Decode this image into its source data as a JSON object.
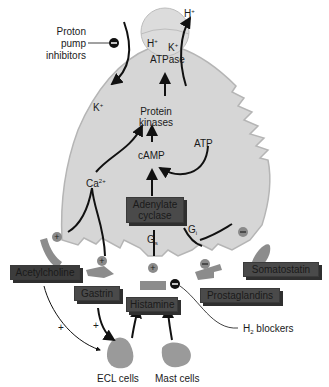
{
  "diagram": {
    "colors": {
      "cell_fill": "#d6d6d6",
      "cell_stroke": "#b0b0b0",
      "receptor": "#8c8c8c",
      "ligand_box": "#4a4a4a",
      "arrow": "#111111",
      "plus_badge": "#8a8a8a",
      "minus_badge": "#111111"
    },
    "labels": {
      "ppi": [
        "Proton",
        "pump",
        "inhibitors"
      ],
      "h_plus_out": "H+",
      "k_plus_in": "K+",
      "pump_h": "H+",
      "pump_k": "K+",
      "atpase": "ATPase",
      "protein_kinases": [
        "Protein",
        "kinases"
      ],
      "camp": "cAMP",
      "atp": "ATP",
      "calcium": "Ca2+",
      "gs": "Gs",
      "gi": "Gi",
      "adenylate_cyclase": [
        "Adenylate",
        "cyclase"
      ],
      "acetylcholine": "Acetylcholine",
      "gastrin": "Gastrin",
      "histamine": "Histamine",
      "somatostatin": "Somatostatin",
      "prostaglandins": "Prostaglandins",
      "h2_blockers": "H2 blockers",
      "ecl_cells": "ECL cells",
      "mast_cells": "Mast cells",
      "plus_sign": "+",
      "minus_sign": "−"
    }
  }
}
